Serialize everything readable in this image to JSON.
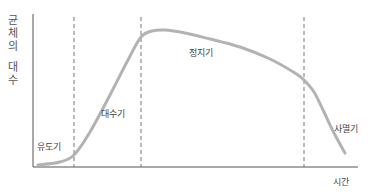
{
  "chart_data": {
    "type": "line",
    "title": "",
    "xlabel": "시간",
    "ylabel": "균체의 대수",
    "ylabel_chars": [
      "균",
      "체",
      "의",
      "",
      "대",
      "수"
    ],
    "phases": [
      {
        "name": "유도기",
        "label": "유도기"
      },
      {
        "name": "대수기",
        "label": "대수기"
      },
      {
        "name": "정지기",
        "label": "정지기"
      },
      {
        "name": "사멸기",
        "label": "사멸기"
      }
    ],
    "phase_boundaries_x": [
      74,
      141,
      304
    ],
    "curve_points": [
      [
        38,
        165
      ],
      [
        60,
        162
      ],
      [
        74,
        155
      ],
      [
        90,
        132
      ],
      [
        110,
        95
      ],
      [
        128,
        60
      ],
      [
        141,
        37
      ],
      [
        152,
        31
      ],
      [
        165,
        30
      ],
      [
        185,
        33
      ],
      [
        210,
        39
      ],
      [
        240,
        47
      ],
      [
        270,
        59
      ],
      [
        295,
        73
      ],
      [
        304,
        80
      ],
      [
        314,
        92
      ],
      [
        324,
        112
      ],
      [
        334,
        133
      ],
      [
        345,
        153
      ]
    ],
    "grid": false,
    "legend": "none",
    "colors": {
      "curve": "#b3b3b3",
      "axis": "#555555",
      "dashed": "#777777"
    }
  },
  "labels": {
    "phase1": "유도기",
    "phase2": "대수기",
    "phase3": "정지기",
    "phase4": "사멸기",
    "xaxis": "시간",
    "y1": "균",
    "y2": "체",
    "y3": "의",
    "y4": "대",
    "y5": "수"
  }
}
